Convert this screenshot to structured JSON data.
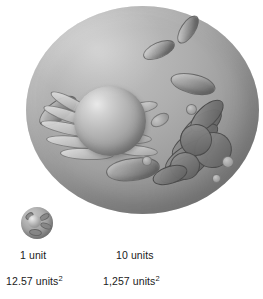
{
  "figure": {
    "background_color": "#ffffff",
    "width": 263,
    "height": 299
  },
  "cells": {
    "small": {
      "name": "small cell",
      "diameter_label": "1 unit",
      "surface_area_label": "12.57 units",
      "surface_area_exponent": "2",
      "fill_color": "#a2a2a2"
    },
    "large": {
      "name": "large cell",
      "diameter_label": "10 units",
      "surface_area_label": "1,257 units",
      "surface_area_exponent": "2",
      "fill_color": "#a8a8a8"
    }
  },
  "organelles": {
    "nucleus": {
      "label": "nucleus",
      "color": "#bdbdbd"
    },
    "mitochondria": {
      "label": "mitochondria",
      "count": 5,
      "color": "#8f8f8f"
    },
    "endoplasmic_reticulum": {
      "label": "endoplasmic reticulum",
      "color": "#c4c4c4"
    },
    "golgi_apparatus": {
      "label": "golgi apparatus",
      "color": "#747474"
    },
    "vesicles": {
      "label": "vesicles",
      "count": 5,
      "color": "#a8a8a8"
    }
  },
  "labels": {
    "unit_small": "1 unit",
    "unit_large": "10 units",
    "area_small_value": "12.57 units",
    "area_small_exp": "2",
    "area_large_value": "1,257 units",
    "area_large_exp": "2"
  }
}
